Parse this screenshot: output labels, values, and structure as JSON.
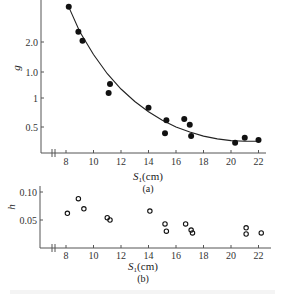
{
  "chart_data": [
    {
      "type": "scatter",
      "panel_label": "(a)",
      "title": "",
      "xlabel": "S1(cm)",
      "xlabel_main": "S",
      "xlabel_sub": "1",
      "xlabel_unit": "(cm)",
      "ylabel": "g",
      "x_ticks": [
        8,
        10,
        12,
        14,
        16,
        18,
        20,
        22
      ],
      "y_ticks": [
        {
          "value": 2.0,
          "label": "2.0"
        },
        {
          "value": 1.5,
          "label": "1.0"
        },
        {
          "value": 1.0,
          "label": "1"
        },
        {
          "value": 0.5,
          "label": "0.5"
        }
      ],
      "xlim": [
        7,
        23
      ],
      "ylim": [
        0.1,
        2.7
      ],
      "grid": false,
      "axis_break_x": true,
      "marker": "filled-circle",
      "fit_curve": true,
      "series": [
        {
          "name": "g",
          "x": [
            8.2,
            8.9,
            9.2,
            11.2,
            11.1,
            14.0,
            15.3,
            15.2,
            16.6,
            17.0,
            17.1,
            20.3,
            21.0,
            22.0
          ],
          "y": [
            2.62,
            2.18,
            2.02,
            1.26,
            1.1,
            0.84,
            0.62,
            0.39,
            0.64,
            0.54,
            0.34,
            0.22,
            0.31,
            0.27
          ]
        }
      ],
      "curve": {
        "x": [
          8.2,
          9,
          10,
          11,
          12,
          13,
          14,
          15,
          16,
          17,
          18,
          19,
          20,
          21,
          22
        ],
        "y": [
          2.62,
          2.18,
          1.78,
          1.44,
          1.17,
          0.95,
          0.77,
          0.62,
          0.5,
          0.41,
          0.34,
          0.29,
          0.26,
          0.25,
          0.25
        ]
      }
    },
    {
      "type": "scatter",
      "panel_label": "(b)",
      "title": "",
      "xlabel": "S1(cm)",
      "xlabel_main": "S",
      "xlabel_sub": "1",
      "xlabel_unit": "(cm)",
      "ylabel": "h",
      "x_ticks": [
        8,
        10,
        12,
        14,
        16,
        18,
        20,
        22
      ],
      "y_ticks": [
        {
          "value": 0.1,
          "label": "0.10"
        },
        {
          "value": 0.05,
          "label": "0.05"
        }
      ],
      "xlim": [
        7,
        23
      ],
      "ylim": [
        0.0,
        0.11
      ],
      "grid": false,
      "axis_break_x": true,
      "marker": "open-circle",
      "series": [
        {
          "name": "h",
          "x": [
            8.1,
            8.9,
            9.3,
            11.0,
            11.2,
            14.1,
            15.2,
            15.3,
            16.7,
            17.1,
            17.2,
            21.1,
            21.1,
            22.2
          ],
          "y": [
            0.062,
            0.088,
            0.07,
            0.054,
            0.05,
            0.066,
            0.043,
            0.03,
            0.043,
            0.032,
            0.027,
            0.036,
            0.025,
            0.027
          ]
        }
      ]
    }
  ],
  "colors": {
    "axis": "#555555",
    "marker": "#111111",
    "curve": "#222222",
    "text": "#333333"
  }
}
